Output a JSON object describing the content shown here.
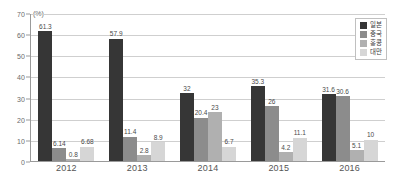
{
  "chart_data": {
    "type": "bar",
    "title": "",
    "subtitle": "",
    "xlabel": "",
    "ylabel": "",
    "unit_label": "(%)",
    "ylim": [
      0,
      70
    ],
    "ytick_step": 10,
    "yticks": [
      "0",
      "10",
      "20",
      "30",
      "40",
      "50",
      "60",
      "70"
    ],
    "grid": true,
    "grid_axis": "y",
    "legend_position": "top-right",
    "categories": [
      "2012",
      "2013",
      "2014",
      "2015",
      "2016"
    ],
    "series": [
      {
        "name": "일본",
        "color": "#363636",
        "values": [
          61.3,
          57.9,
          32,
          35.3,
          31.6
        ],
        "labels": [
          "61.3",
          "57.9",
          "32",
          "35.3",
          "31.6"
        ]
      },
      {
        "name": "중국",
        "color": "#8c8c8c",
        "values": [
          6.14,
          11.4,
          20.4,
          26,
          30.6
        ],
        "labels": [
          "6.14",
          "11.4",
          "20.4",
          "26",
          "30.6"
        ]
      },
      {
        "name": "홍콩",
        "color": "#b0b0b0",
        "values": [
          0.8,
          2.8,
          23,
          4.2,
          5.1
        ],
        "labels": [
          "0.8",
          "2.8",
          "23",
          "4.2",
          "5.1"
        ]
      },
      {
        "name": "대만",
        "color": "#d6d6d6",
        "values": [
          6.68,
          8.9,
          6.7,
          11.1,
          10
        ],
        "labels": [
          "6.68",
          "8.9",
          "6.7",
          "11.1",
          "10"
        ]
      }
    ]
  }
}
